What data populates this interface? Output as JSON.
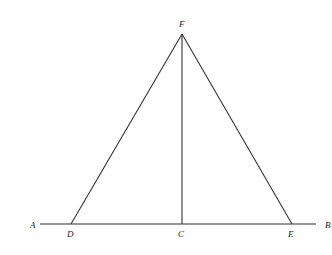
{
  "diagram": {
    "type": "geometry",
    "points": {
      "A": {
        "label": "A",
        "x": 33,
        "y": 227
      },
      "B": {
        "label": "B",
        "x": 326,
        "y": 227
      },
      "C": {
        "label": "C",
        "x": 182,
        "y": 224
      },
      "D": {
        "label": "D",
        "x": 71,
        "y": 224
      },
      "E": {
        "label": "E",
        "x": 292,
        "y": 224
      },
      "F": {
        "label": "F",
        "x": 182,
        "y": 34
      }
    },
    "segments": [
      {
        "from": "A",
        "to": "B",
        "x1": 40,
        "y1": 224,
        "x2": 316,
        "y2": 224
      },
      {
        "from": "F",
        "to": "D",
        "x1": 182,
        "y1": 34,
        "x2": 71,
        "y2": 224
      },
      {
        "from": "F",
        "to": "E",
        "x1": 182,
        "y1": 34,
        "x2": 292,
        "y2": 224
      },
      {
        "from": "F",
        "to": "C",
        "x1": 182,
        "y1": 34,
        "x2": 182,
        "y2": 224
      }
    ],
    "labels": {
      "A": "A",
      "B": "B",
      "C": "C",
      "D": "D",
      "E": "E",
      "F": "F"
    }
  }
}
